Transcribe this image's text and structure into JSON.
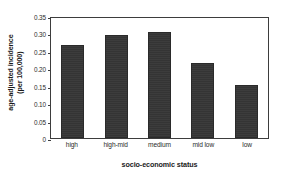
{
  "chart_data": {
    "type": "bar",
    "title": "",
    "xlabel": "socio-economic status",
    "ylabel": "age-adjusted incidence\n(per 100,000)",
    "ylabel_line1": "age-adjusted incidence",
    "ylabel_line2": "(per 100,000)",
    "categories": [
      "high",
      "high-mid",
      "medium",
      "mid low",
      "low"
    ],
    "values": [
      0.27,
      0.3,
      0.31,
      0.22,
      0.155
    ],
    "ylim": [
      0,
      0.35
    ],
    "yticks": [
      0.35,
      0.3,
      0.25,
      0.2,
      0.15,
      0.1,
      0.05,
      0
    ],
    "ytick_labels": [
      "0.35",
      "0.30",
      "0.25",
      "0.20",
      "0.15",
      "0.10",
      "0.05",
      "0"
    ],
    "grid": false,
    "legend": false,
    "bar_color": "#3a3a3a",
    "frame_color": "#3d3d3d",
    "background": "#ffffff"
  }
}
